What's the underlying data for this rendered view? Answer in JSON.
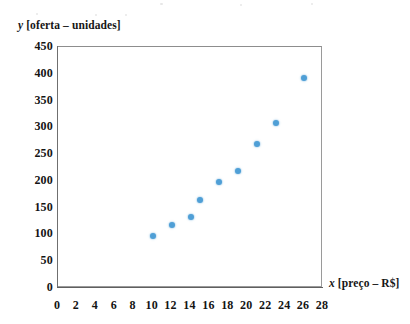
{
  "chart_data": {
    "type": "scatter",
    "title": "",
    "xlabel": "x [preço – R$]",
    "ylabel": "y [oferta – unidades]",
    "xlim": [
      0,
      28
    ],
    "ylim": [
      0,
      450
    ],
    "grid": false,
    "legend": null,
    "xticks": [
      0,
      2,
      4,
      6,
      8,
      10,
      12,
      14,
      16,
      18,
      20,
      22,
      24,
      26,
      28
    ],
    "yticks": [
      0,
      50,
      100,
      150,
      200,
      250,
      300,
      350,
      400,
      450
    ],
    "series": [
      {
        "name": "oferta",
        "color": "#4f9fd6",
        "x": [
          10,
          12,
          14,
          15,
          17,
          19,
          21,
          23,
          26
        ],
        "y": [
          98,
          118,
          133,
          165,
          198,
          219,
          268,
          308,
          392
        ],
        "points": [
          {
            "x": 10,
            "y": 98
          },
          {
            "x": 12,
            "y": 118
          },
          {
            "x": 14,
            "y": 133
          },
          {
            "x": 15,
            "y": 165
          },
          {
            "x": 17,
            "y": 198
          },
          {
            "x": 19,
            "y": 219
          },
          {
            "x": 21,
            "y": 268
          },
          {
            "x": 23,
            "y": 308
          },
          {
            "x": 26,
            "y": 392
          }
        ]
      }
    ]
  },
  "labels": {
    "y_axis_title_var": "y",
    "y_axis_title_rest": " [oferta – unidades]",
    "x_axis_title_var": "x",
    "x_axis_title_rest": " [preço – R$]"
  },
  "colors": {
    "marker": "#4f9fd6",
    "frame": "#9a9a9a",
    "axis": "#6f6f6f",
    "text": "#141414",
    "background": "#ffffff"
  }
}
